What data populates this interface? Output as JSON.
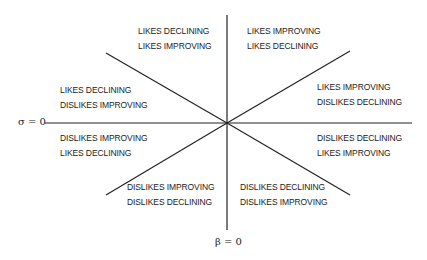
{
  "axes": {
    "horizontal_label": "σ = 0",
    "vertical_label": "β = 0"
  },
  "regions": [
    {
      "id": "top-left",
      "line1": "LIKES DECLINING",
      "line2": "LIKES IMPROVING"
    },
    {
      "id": "top-right",
      "line1": "LIKES IMPROVING",
      "line2": "LIKES DECLINING"
    },
    {
      "id": "left-upper",
      "line1": "LIKES DECLINING",
      "line2": "DISLIKES IMPROVING"
    },
    {
      "id": "right-upper",
      "line1": "LIKES IMPROVING",
      "line2": "DISLIKES DECLINING"
    },
    {
      "id": "left-lower",
      "line1": "DISLIKES IMPROVING",
      "line2": "LIKES DECLINING"
    },
    {
      "id": "right-lower",
      "line1": "DISLIKES DECLINING",
      "line2": "LIKES IMPROVING"
    },
    {
      "id": "bottom-left",
      "line1": "DISLIKES IMPROVING",
      "line2": "DISLIKES DECLINING"
    },
    {
      "id": "bottom-right",
      "line1": "DISLIKES DECLINING",
      "line2": "DISLIKES IMPROVING"
    }
  ]
}
